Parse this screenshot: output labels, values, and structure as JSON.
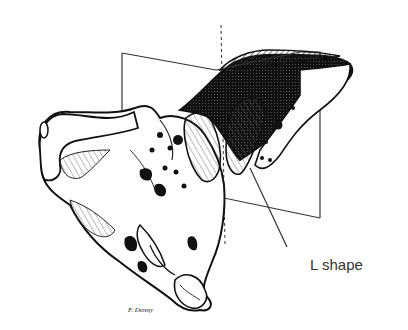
{
  "figure": {
    "annotation": {
      "text": "L shape",
      "x": 310,
      "y": 248
    },
    "signature": "F. Denny",
    "colors": {
      "ink": "#111111",
      "plane_line": "#333333",
      "label": "#333333",
      "background": "#ffffff"
    }
  }
}
